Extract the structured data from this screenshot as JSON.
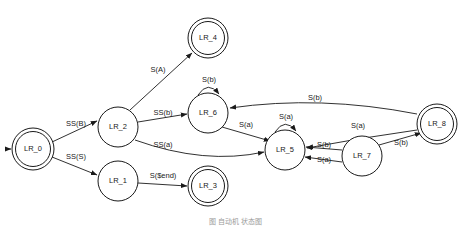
{
  "figure": {
    "caption": "图        自动机        状态图",
    "caption_y": 216,
    "background": "#ffffff",
    "stroke_color": "#1a1a1a",
    "text_color": "#1a1a1a"
  },
  "diagram": {
    "type": "state-machine",
    "width": 471,
    "height": 226,
    "node_radius": 20,
    "accepting_inner_offset": 3.5,
    "nodes": [
      {
        "id": "LR_0",
        "label": "LR_0",
        "cx": 33,
        "cy": 149,
        "r": 21,
        "accepting": true,
        "start": true
      },
      {
        "id": "LR_1",
        "label": "LR_1",
        "cx": 118,
        "cy": 181,
        "r": 20,
        "accepting": false,
        "start": false
      },
      {
        "id": "LR_2",
        "label": "LR_2",
        "cx": 118,
        "cy": 127,
        "r": 20,
        "accepting": false,
        "start": false
      },
      {
        "id": "LR_3",
        "label": "LR_3",
        "cx": 208,
        "cy": 186,
        "r": 20,
        "accepting": true,
        "start": false
      },
      {
        "id": "LR_4",
        "label": "LR_4",
        "cx": 208,
        "cy": 38,
        "r": 20,
        "accepting": true,
        "start": false
      },
      {
        "id": "LR_5",
        "label": "LR_5",
        "cx": 285,
        "cy": 150,
        "r": 20,
        "accepting": false,
        "start": false
      },
      {
        "id": "LR_6",
        "label": "LR_6",
        "cx": 208,
        "cy": 113,
        "r": 20,
        "accepting": false,
        "start": false
      },
      {
        "id": "LR_7",
        "label": "LR_7",
        "cx": 362,
        "cy": 156,
        "r": 20,
        "accepting": false,
        "start": false
      },
      {
        "id": "LR_8",
        "label": "LR_8",
        "cx": 437,
        "cy": 124,
        "r": 20,
        "accepting": true,
        "start": false
      }
    ],
    "edges": [
      {
        "from": "LR_0",
        "to": "LR_2",
        "label": "SS(B)",
        "label_x": 76,
        "label_y": 124,
        "path": "M 52 142 L 97 121",
        "self": false
      },
      {
        "from": "LR_0",
        "to": "LR_1",
        "label": "SS(S)",
        "label_x": 76,
        "label_y": 157,
        "path": "M 52 157 L 97 175",
        "self": false
      },
      {
        "from": "LR_2",
        "to": "LR_4",
        "label": "S(A)",
        "label_x": 158,
        "label_y": 70,
        "path": "M 130 110 L 192 53",
        "self": false
      },
      {
        "from": "LR_2",
        "to": "LR_6",
        "label": "SS(b)",
        "label_x": 163,
        "label_y": 113,
        "path": "M 138 122 L 187 114",
        "self": false
      },
      {
        "from": "LR_2",
        "to": "LR_5",
        "label": "SS(a)",
        "label_x": 163,
        "label_y": 145,
        "path": "M 135 140 Q 205 165 264 152",
        "self": false
      },
      {
        "from": "LR_1",
        "to": "LR_3",
        "label": "S($end)",
        "label_x": 163,
        "label_y": 176,
        "path": "M 138 183 L 187 186",
        "self": false
      },
      {
        "from": "LR_6",
        "to": "LR_6",
        "label": "S(b)",
        "label_x": 209,
        "label_y": 80,
        "path": "M 198 95 Q 208 80 219 94",
        "self": true
      },
      {
        "from": "LR_6",
        "to": "LR_5",
        "label": "S(a)",
        "label_x": 246,
        "label_y": 125,
        "path": "M 222 127 L 270 141",
        "self": false
      },
      {
        "from": "LR_5",
        "to": "LR_5",
        "label": "S(a)",
        "label_x": 286,
        "label_y": 117,
        "path": "M 275 132 Q 285 117 296 131",
        "self": true
      },
      {
        "from": "LR_8",
        "to": "LR_6",
        "label": "S(b)",
        "label_x": 315,
        "label_y": 98,
        "path": "M 417 114 Q 320 95 230 108",
        "self": false
      },
      {
        "from": "LR_8",
        "to": "LR_5",
        "label": "S(a)",
        "label_x": 358,
        "label_y": 126,
        "path": "M 417 130 Q 360 138 307 148",
        "self": false
      },
      {
        "from": "LR_7",
        "to": "LR_5",
        "label": "S(b)",
        "label_x": 324,
        "label_y": 145,
        "path": "M 342 150 L 306 147",
        "self": false
      },
      {
        "from": "LR_7",
        "to": "LR_5",
        "label": "S(a)",
        "label_x": 324,
        "label_y": 160,
        "path": "M 342 162 L 305 157",
        "self": false
      },
      {
        "from": "LR_7",
        "to": "LR_8",
        "label": "S(b)",
        "label_x": 401,
        "label_y": 143,
        "path": "M 379 145 L 421 133",
        "self": false
      }
    ],
    "start_arrow": {
      "path": "M 6 149 L 11 149"
    },
    "symbols": [
      "S(A)",
      "S(a)",
      "S(b)",
      "S($end)",
      "SS(B)",
      "SS(S)",
      "SS(a)",
      "SS(b)"
    ]
  }
}
